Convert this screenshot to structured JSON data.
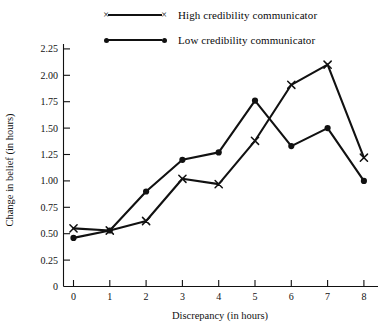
{
  "chart_data": {
    "type": "line",
    "title": "",
    "xlabel": "Discrepancy (in hours)",
    "ylabel": "Change in belief (in hours)",
    "x": [
      0,
      1,
      2,
      3,
      4,
      5,
      6,
      7,
      8
    ],
    "xtick_labels": [
      "0",
      "1",
      "2",
      "3",
      "4",
      "5",
      "6",
      "7",
      "8"
    ],
    "ytick_labels": [
      "0",
      "0.25",
      "0.50",
      "0.75",
      "1.00",
      "1.25",
      "1.50",
      "1.75",
      "2.00",
      "2.25"
    ],
    "ytick_values": [
      0,
      0.25,
      0.5,
      0.75,
      1.0,
      1.25,
      1.5,
      1.75,
      2.0,
      2.25
    ],
    "xlim": [
      -0.35,
      8.4
    ],
    "ylim": [
      0,
      2.4
    ],
    "grid": false,
    "legend_position": "top-center",
    "series": [
      {
        "name": "High credibility communicator",
        "marker": "x",
        "color": "#111111",
        "values": [
          0.55,
          0.53,
          0.62,
          1.02,
          0.97,
          1.38,
          1.91,
          2.1,
          1.22
        ]
      },
      {
        "name": "Low credibility communicator",
        "marker": "dot",
        "color": "#111111",
        "values": [
          0.46,
          0.53,
          0.9,
          1.2,
          1.27,
          1.76,
          1.33,
          1.5,
          1.0
        ]
      }
    ]
  },
  "legend": {
    "entries": [
      {
        "label": "High credibility communicator",
        "marker": "x"
      },
      {
        "label": "Low credibility communicator",
        "marker": "dot"
      }
    ]
  },
  "axes": {
    "x_title": "Discrepancy (in hours)",
    "y_title": "Change in belief (in hours)"
  }
}
